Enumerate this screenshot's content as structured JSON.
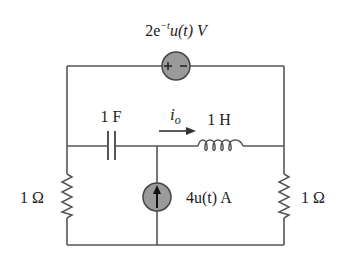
{
  "diagram": {
    "type": "circuit",
    "components": {
      "voltage_source": {
        "label": "2e",
        "exp": "−t",
        "rest": "u(t) V",
        "polarity": [
          "+",
          "−"
        ]
      },
      "capacitor": {
        "label": "1 F"
      },
      "inductor": {
        "label": "1 H"
      },
      "current_label": {
        "symbol": "i",
        "subscript": "o"
      },
      "current_source": {
        "label": "4u(t) A"
      },
      "resistor_left": {
        "label": "1 Ω"
      },
      "resistor_right": {
        "label": "1 Ω"
      }
    },
    "colors": {
      "wire": "#555555",
      "source_fill": "#9a9a9a",
      "source_stroke": "#444444"
    }
  }
}
